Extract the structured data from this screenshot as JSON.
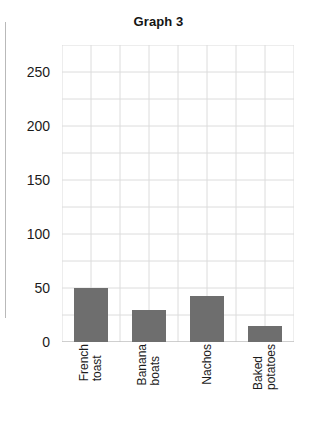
{
  "chart_data": {
    "type": "bar",
    "title": "Graph 3",
    "xlabel": "",
    "ylabel": "",
    "categories": [
      "French toast",
      "Banana boats",
      "Nachos",
      "Baked potatoes"
    ],
    "category_lines": [
      [
        "French",
        "toast"
      ],
      [
        "Banana",
        "boats"
      ],
      [
        "Nachos"
      ],
      [
        "Baked",
        "potatoes"
      ]
    ],
    "values": [
      50,
      30,
      43,
      15
    ],
    "ylim": [
      0,
      275
    ],
    "yticks": [
      0,
      50,
      100,
      150,
      200,
      250
    ],
    "ytick_labels": [
      "0",
      "50",
      "100",
      "150",
      "200",
      "250"
    ],
    "grid": true,
    "grid_horizontal_step": 25,
    "grid_vertical_cells": 8,
    "legend": "none",
    "bar_color": "#6e6e6e",
    "grid_color": "#dcdcdc",
    "text_color": "#1b1b1b"
  }
}
